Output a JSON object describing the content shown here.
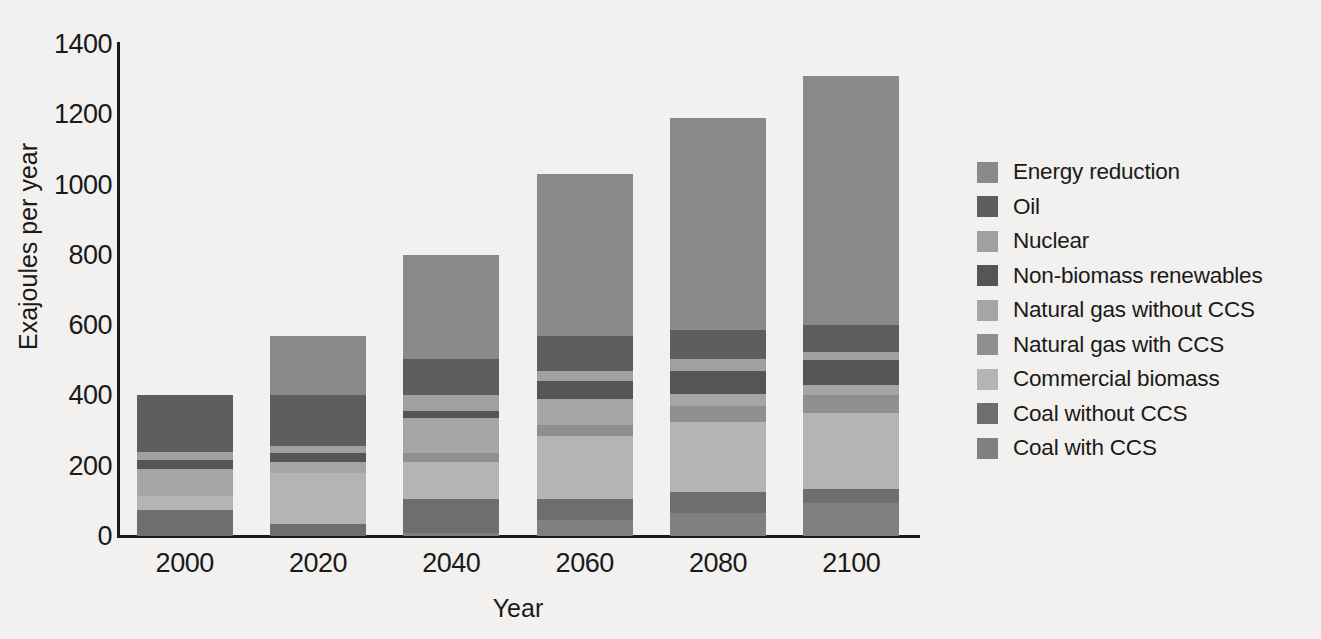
{
  "chart_data": {
    "type": "bar",
    "subtype": "stacked",
    "title": "",
    "xlabel": "Year",
    "ylabel": "Exajoules per year",
    "categories": [
      "2000",
      "2020",
      "2040",
      "2060",
      "2080",
      "2100"
    ],
    "ylim": [
      0,
      1400
    ],
    "yticks": [
      0,
      200,
      400,
      600,
      800,
      1000,
      1200,
      1400
    ],
    "ytick_labels": [
      "0",
      "200",
      "400",
      "600",
      "800",
      "1000",
      "1200",
      "1400"
    ],
    "grid": false,
    "legend_position": "right",
    "stack_order_bottom_to_top": [
      "Coal with CCS",
      "Coal without CCS",
      "Commercial biomass",
      "Natural gas with CCS",
      "Natural gas without CCS",
      "Non-biomass renewables",
      "Nuclear",
      "Oil",
      "Energy reduction"
    ],
    "series": [
      {
        "name": "Coal with CCS",
        "color": "#808080",
        "values": [
          0,
          0,
          10,
          45,
          65,
          95
        ]
      },
      {
        "name": "Coal without CCS",
        "color": "#6e6e6e",
        "values": [
          75,
          35,
          95,
          60,
          60,
          40
        ]
      },
      {
        "name": "Commercial biomass",
        "color": "#b4b4b4",
        "values": [
          40,
          145,
          105,
          180,
          200,
          215
        ]
      },
      {
        "name": "Natural gas with CCS",
        "color": "#8f8f8f",
        "values": [
          0,
          0,
          25,
          30,
          45,
          50
        ]
      },
      {
        "name": "Natural gas without CCS",
        "color": "#a5a5a5",
        "values": [
          75,
          30,
          100,
          75,
          35,
          30
        ]
      },
      {
        "name": "Non-biomass renewables",
        "color": "#555555",
        "values": [
          25,
          25,
          20,
          50,
          65,
          70
        ]
      },
      {
        "name": "Nuclear",
        "color": "#a0a0a0",
        "values": [
          25,
          20,
          45,
          30,
          35,
          25
        ]
      },
      {
        "name": "Oil",
        "color": "#5e5e5e",
        "values": [
          160,
          145,
          105,
          100,
          80,
          75
        ]
      },
      {
        "name": "Energy reduction",
        "color": "#8a8a8a",
        "values": [
          0,
          170,
          295,
          460,
          605,
          710
        ]
      }
    ],
    "totals": [
      400,
      570,
      790,
      1030,
      1190,
      1310
    ]
  },
  "legend": {
    "items": [
      {
        "label": "Energy reduction",
        "color": "#8a8a8a"
      },
      {
        "label": "Oil",
        "color": "#5e5e5e"
      },
      {
        "label": "Nuclear",
        "color": "#a0a0a0"
      },
      {
        "label": "Non-biomass renewables",
        "color": "#555555"
      },
      {
        "label": "Natural gas without CCS",
        "color": "#a5a5a5"
      },
      {
        "label": "Natural gas with CCS",
        "color": "#8f8f8f"
      },
      {
        "label": "Commercial biomass",
        "color": "#b4b4b4"
      },
      {
        "label": "Coal without CCS",
        "color": "#6e6e6e"
      },
      {
        "label": "Coal with CCS",
        "color": "#808080"
      }
    ]
  },
  "colors": {
    "background": "#f2f1ef",
    "axis": "#1a1a1a",
    "text": "#1a1a1a"
  }
}
